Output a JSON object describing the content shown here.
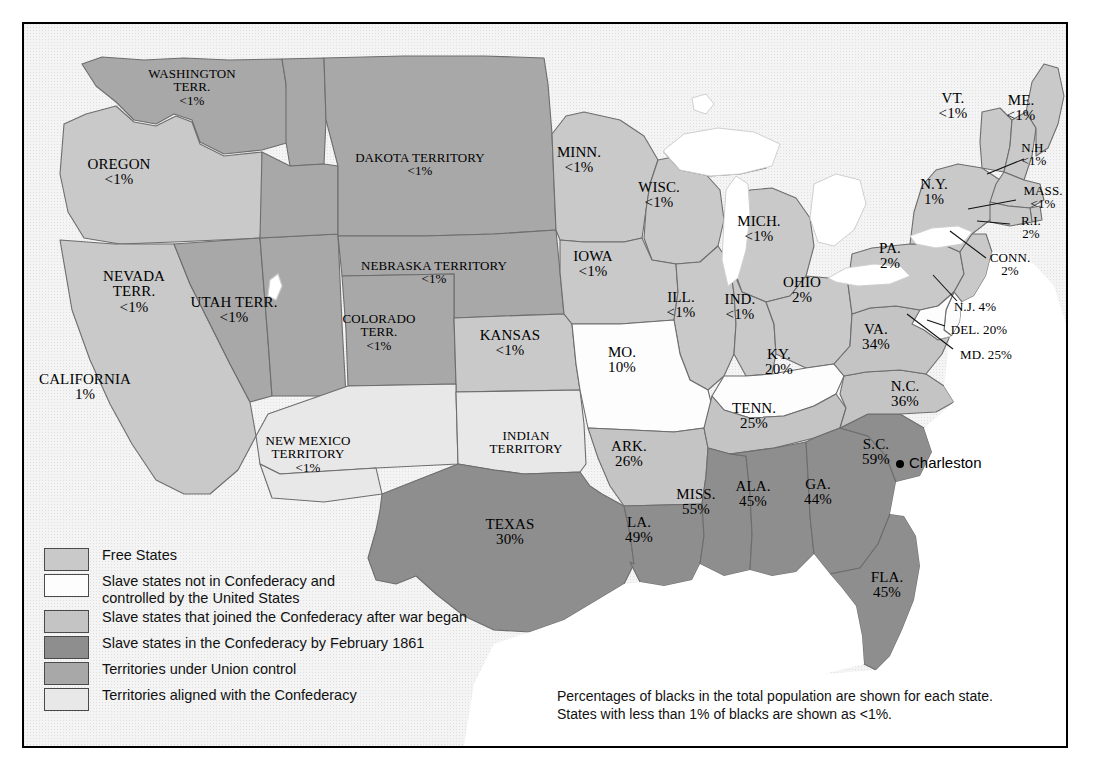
{
  "map": {
    "title": "Slavery and secession in the United States, 1861",
    "colors": {
      "free_states": "#c9c9c9",
      "slave_union": "#fdfdfd",
      "joined_after": "#c4c4c4",
      "confederacy_feb": "#8e8e8e",
      "union_territory": "#a8a8a8",
      "confederate_territory": "#e8e8e8",
      "water": "#ffffff",
      "outside": "#f4f4f4",
      "border": "#6d6d6d",
      "frame": "#000000"
    },
    "states": [
      {
        "id": "washington-terr",
        "name": "WASHINGTON\nTERR.",
        "pct": "<1%",
        "x": 190,
        "y": 85,
        "cat": "union_territory"
      },
      {
        "id": "oregon",
        "name": "OREGON",
        "pct": "<1%",
        "x": 117,
        "y": 170,
        "cat": "free_states"
      },
      {
        "id": "california",
        "name": "CALIFORNIA",
        "pct": "1%",
        "x": 83,
        "y": 385,
        "cat": "free_states"
      },
      {
        "id": "nevada-terr",
        "name": "NEVADA\nTERR.",
        "pct": "<1%",
        "x": 132,
        "y": 290,
        "cat": "union_territory"
      },
      {
        "id": "utah-terr",
        "name": "UTAH TERR.",
        "pct": "<1%",
        "x": 232,
        "y": 308,
        "cat": "union_territory"
      },
      {
        "id": "dakota-territory",
        "name": "DAKOTA TERRITORY",
        "pct": "<1%",
        "x": 418,
        "y": 162,
        "cat": "union_territory"
      },
      {
        "id": "nebraska-territory",
        "name": "NEBRASKA TERRITORY",
        "pct": "<1%",
        "x": 432,
        "y": 270,
        "cat": "union_territory"
      },
      {
        "id": "colorado-terr",
        "name": "COLORADO\nTERR.",
        "pct": "<1%",
        "x": 377,
        "y": 330,
        "cat": "union_territory"
      },
      {
        "id": "new-mexico-territory",
        "name": "NEW MEXICO\nTERRITORY",
        "pct": "<1%",
        "x": 306,
        "y": 452,
        "cat": "confederate_territory"
      },
      {
        "id": "indian-territory",
        "name": "INDIAN\nTERRITORY",
        "pct": "",
        "x": 524,
        "y": 440,
        "cat": "confederate_territory"
      },
      {
        "id": "kansas",
        "name": "KANSAS",
        "pct": "<1%",
        "x": 508,
        "y": 341,
        "cat": "free_states"
      },
      {
        "id": "minn",
        "name": "MINN.",
        "pct": "<1%",
        "x": 577,
        "y": 158,
        "cat": "free_states"
      },
      {
        "id": "wisc",
        "name": "WISC.",
        "pct": "<1%",
        "x": 657,
        "y": 193,
        "cat": "free_states"
      },
      {
        "id": "iowa",
        "name": "IOWA",
        "pct": "<1%",
        "x": 591,
        "y": 262,
        "cat": "free_states"
      },
      {
        "id": "mich",
        "name": "MICH.",
        "pct": "<1%",
        "x": 757,
        "y": 227,
        "cat": "free_states"
      },
      {
        "id": "ill",
        "name": "ILL.",
        "pct": "<1%",
        "x": 679,
        "y": 303,
        "cat": "free_states"
      },
      {
        "id": "ind",
        "name": "IND.",
        "pct": "<1%",
        "x": 738,
        "y": 305,
        "cat": "free_states"
      },
      {
        "id": "ohio",
        "name": "OHIO",
        "pct": "2%",
        "x": 800,
        "y": 288,
        "cat": "free_states"
      },
      {
        "id": "mo",
        "name": "MO.",
        "pct": "10%",
        "x": 620,
        "y": 358,
        "cat": "slave_union"
      },
      {
        "id": "ky",
        "name": "KY.",
        "pct": "20%",
        "x": 777,
        "y": 360,
        "cat": "slave_union"
      },
      {
        "id": "tenn",
        "name": "TENN.",
        "pct": "25%",
        "x": 752,
        "y": 414,
        "cat": "joined_after"
      },
      {
        "id": "ark",
        "name": "ARK.",
        "pct": "26%",
        "x": 627,
        "y": 452,
        "cat": "joined_after"
      },
      {
        "id": "va",
        "name": "VA.",
        "pct": "34%",
        "x": 874,
        "y": 335,
        "cat": "joined_after"
      },
      {
        "id": "nc",
        "name": "N.C.",
        "pct": "36%",
        "x": 903,
        "y": 392,
        "cat": "joined_after"
      },
      {
        "id": "sc",
        "name": "S.C.",
        "pct": "59%",
        "x": 874,
        "y": 450,
        "cat": "confederacy_feb"
      },
      {
        "id": "ga",
        "name": "GA.",
        "pct": "44%",
        "x": 816,
        "y": 490,
        "cat": "confederacy_feb"
      },
      {
        "id": "ala",
        "name": "ALA.",
        "pct": "45%",
        "x": 751,
        "y": 492,
        "cat": "confederacy_feb"
      },
      {
        "id": "miss",
        "name": "MISS.",
        "pct": "55%",
        "x": 694,
        "y": 500,
        "cat": "confederacy_feb"
      },
      {
        "id": "la",
        "name": "LA.",
        "pct": "49%",
        "x": 637,
        "y": 528,
        "cat": "confederacy_feb"
      },
      {
        "id": "texas",
        "name": "TEXAS",
        "pct": "30%",
        "x": 508,
        "y": 530,
        "cat": "confederacy_feb"
      },
      {
        "id": "fla",
        "name": "FLA.",
        "pct": "45%",
        "x": 885,
        "y": 583,
        "cat": "confederacy_feb"
      },
      {
        "id": "pa",
        "name": "PA.",
        "pct": "2%",
        "x": 888,
        "y": 254,
        "cat": "free_states"
      },
      {
        "id": "ny",
        "name": "N.Y.",
        "pct": "1%",
        "x": 932,
        "y": 190,
        "cat": "free_states"
      },
      {
        "id": "vt",
        "name": "VT.",
        "pct": "<1%",
        "x": 951,
        "y": 104,
        "cat": "free_states"
      },
      {
        "id": "me",
        "name": "ME.",
        "pct": "<1%",
        "x": 1019,
        "y": 106,
        "cat": "free_states"
      }
    ],
    "callout_states": [
      {
        "id": "nh",
        "name": "N.H.",
        "pct": "<1%",
        "x": 1032,
        "y": 152,
        "cat": "free_states",
        "leader": [
          [
            1022,
            157
          ],
          [
            985,
            172
          ]
        ]
      },
      {
        "id": "mass",
        "name": "MASS.",
        "pct": "<1%",
        "x": 1041,
        "y": 195,
        "cat": "free_states",
        "leader": [
          [
            1014,
            198
          ],
          [
            966,
            207
          ]
        ]
      },
      {
        "id": "ri",
        "name": "R.I.",
        "pct": "2%",
        "x": 1029,
        "y": 225,
        "cat": "free_states",
        "leader": [
          [
            1008,
            222
          ],
          [
            975,
            219
          ]
        ]
      },
      {
        "id": "conn",
        "name": "CONN.",
        "pct": "2%",
        "x": 1008,
        "y": 262,
        "cat": "free_states",
        "leader": [
          [
            984,
            256
          ],
          [
            948,
            229
          ]
        ]
      },
      {
        "id": "nj",
        "name": "N.J. 4%",
        "pct": "",
        "x": 973,
        "y": 304,
        "cat": "free_states",
        "leader": [
          [
            955,
            299
          ],
          [
            931,
            273
          ]
        ]
      },
      {
        "id": "del",
        "name": "DEL. 20%",
        "pct": "",
        "x": 977,
        "y": 327,
        "cat": "slave_union",
        "leader": [
          [
            943,
            324
          ],
          [
            925,
            318
          ]
        ]
      },
      {
        "id": "md",
        "name": "MD. 25%",
        "pct": "",
        "x": 984,
        "y": 352,
        "cat": "slave_union",
        "leader": [
          [
            951,
            347
          ],
          [
            905,
            312
          ]
        ]
      }
    ],
    "cities": [
      {
        "id": "charleston",
        "name": "Charleston",
        "x": 898,
        "y": 462
      }
    ]
  },
  "legend": {
    "items": [
      {
        "id": "free-states",
        "label": "Free States",
        "color": "#c9c9c9"
      },
      {
        "id": "slave-union",
        "label": "Slave states not in Confederacy and\ncontrolled by the United States",
        "color": "#fdfdfd"
      },
      {
        "id": "joined-after",
        "label": "Slave states that joined the Confederacy after war began",
        "color": "#c4c4c4"
      },
      {
        "id": "confederacy-feb",
        "label": "Slave states in the Confederacy by February 1861",
        "color": "#8e8e8e"
      },
      {
        "id": "union-territory",
        "label": "Territories under Union control",
        "color": "#a8a8a8"
      },
      {
        "id": "confederate-territory",
        "label": "Territories aligned with the Confederacy",
        "color": "#e8e8e8"
      }
    ]
  },
  "note": {
    "line1": "Percentages of blacks in the total population are shown for each state.",
    "line2": "States with less than 1% of blacks are shown as <1%."
  }
}
